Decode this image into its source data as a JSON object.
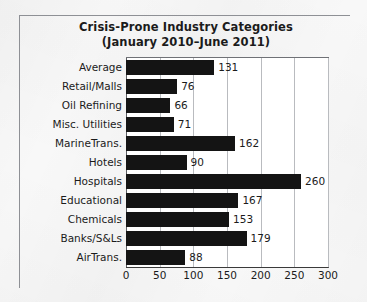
{
  "chart_data": {
    "type": "bar",
    "orientation": "horizontal",
    "title": "Crisis-Prone Industry Categories",
    "subtitle": "(January 2010–June 2011)",
    "xlabel": "",
    "ylabel": "",
    "xlim": [
      0,
      300
    ],
    "xticks": [
      0,
      50,
      100,
      150,
      200,
      250,
      300
    ],
    "grid": true,
    "legend": false,
    "bar_color": "#141414",
    "categories": [
      "Average",
      "Retail/Malls",
      "Oil Refining",
      "Misc. Utilities",
      "MarineTrans.",
      "Hotels",
      "Hospitals",
      "Educational",
      "Chemicals",
      "Banks/S&Ls",
      "AirTrans."
    ],
    "values": [
      131,
      76,
      66,
      71,
      162,
      90,
      260,
      167,
      153,
      179,
      88
    ],
    "data_labels": [
      "131",
      "76",
      "66",
      "71",
      "162",
      "90",
      "260",
      "167",
      "153",
      "179",
      "88"
    ]
  }
}
